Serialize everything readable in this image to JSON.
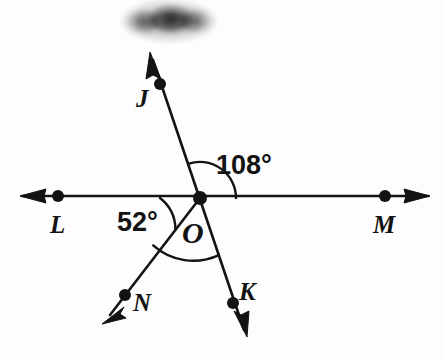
{
  "figure": {
    "type": "geometry-angle-diagram",
    "background_color": "#fdfdfd",
    "ink_color": "#131313",
    "width": 443,
    "height": 360
  },
  "vertex": {
    "name": "O",
    "label": "O",
    "x": 200,
    "y": 198
  },
  "points": [
    {
      "id": "J",
      "label": "J",
      "x": 160,
      "y": 84,
      "label_x": 143,
      "label_y": 105
    },
    {
      "id": "L",
      "label": "L",
      "x": 58,
      "y": 196,
      "label_x": 52,
      "label_y": 231
    },
    {
      "id": "M",
      "label": "M",
      "x": 385,
      "y": 196,
      "label_x": 375,
      "label_y": 231
    },
    {
      "id": "N",
      "label": "N",
      "x": 125,
      "y": 295,
      "label_x": 137,
      "label_y": 312
    },
    {
      "id": "K",
      "label": "K",
      "x": 233,
      "y": 303,
      "label_x": 243,
      "label_y": 300
    }
  ],
  "rays": [
    {
      "id": "ray-OJ",
      "from": "O",
      "through": "J",
      "arrow_x": 150,
      "arrow_y": 53
    },
    {
      "id": "ray-OL",
      "from": "O",
      "through": "L",
      "arrow_x": 20,
      "arrow_y": 196
    },
    {
      "id": "ray-OM",
      "from": "O",
      "through": "M",
      "arrow_x": 430,
      "arrow_y": 196
    },
    {
      "id": "ray-ON",
      "from": "O",
      "through": "N",
      "arrow_x": 104,
      "arrow_y": 322
    },
    {
      "id": "ray-OK",
      "from": "O",
      "through": "K",
      "arrow_x": 247,
      "arrow_y": 335
    }
  ],
  "angles": [
    {
      "id": "angle-JOM",
      "label": "108°",
      "value": 108,
      "unit": "degrees",
      "between": [
        "J",
        "M"
      ],
      "label_x": 218,
      "label_y": 172,
      "arc_radius": 36
    },
    {
      "id": "angle-LON",
      "label": "52°",
      "value": 52,
      "unit": "degrees",
      "between": [
        "L",
        "N"
      ],
      "label_x": 118,
      "label_y": 230,
      "arc_radius": 40
    },
    {
      "id": "angle-NOK",
      "label": "",
      "value": null,
      "unit": "degrees",
      "between": [
        "N",
        "K"
      ],
      "label_x": null,
      "label_y": null,
      "arc_radius": 60
    }
  ],
  "annotations": {
    "smudge": {
      "name": "redacted-smudge",
      "x": 120,
      "y": -4,
      "width": 98,
      "height": 50
    }
  }
}
